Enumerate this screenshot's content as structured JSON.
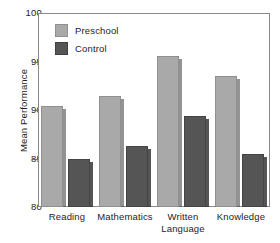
{
  "chart_data": {
    "type": "bar",
    "title": "",
    "xlabel": "",
    "ylabel": "Mean Performance",
    "categories": [
      "Reading",
      "Mathematics",
      "Written Language",
      "Knowledge"
    ],
    "category_lines": [
      [
        "Reading"
      ],
      [
        "Mathematics"
      ],
      [
        "Written",
        "Language"
      ],
      [
        "Knowledge"
      ]
    ],
    "series": [
      {
        "name": "Preschool",
        "color": "#a9a9a9",
        "values": [
          90.4,
          91.4,
          95.6,
          93.5
        ]
      },
      {
        "name": "Control",
        "color": "#555555",
        "values": [
          84.9,
          86.3,
          89.4,
          85.5
        ]
      }
    ],
    "ylim": [
      80,
      100
    ],
    "yticks": [
      80,
      85,
      90,
      95,
      100
    ],
    "ytick_labels": [
      "80",
      "85",
      "90",
      "95",
      "100"
    ],
    "grid": false,
    "legend_position": "top-left"
  },
  "axes": {
    "y_label": "Mean Performance",
    "y_ticks": [
      {
        "label": "100",
        "value": 100
      },
      {
        "label": "95",
        "value": 95
      },
      {
        "label": "90",
        "value": 90
      },
      {
        "label": "85",
        "value": 85
      },
      {
        "label": "80",
        "value": 80
      }
    ]
  },
  "legend": {
    "items": [
      {
        "label": "Preschool",
        "color": "#a9a9a9"
      },
      {
        "label": "Control",
        "color": "#555555"
      }
    ]
  }
}
